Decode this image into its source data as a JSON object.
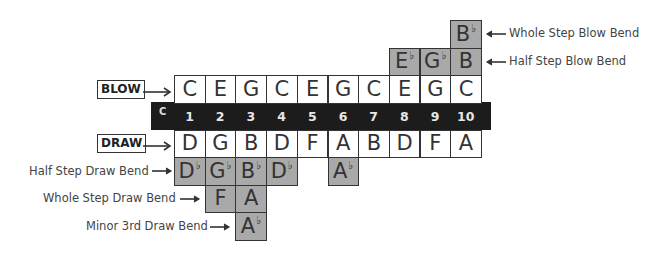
{
  "diagram": {
    "key_label": "C",
    "holes": [
      "1",
      "2",
      "3",
      "4",
      "5",
      "6",
      "7",
      "8",
      "9",
      "10"
    ],
    "row_labels": {
      "blow": "BLOW",
      "draw": "DRAW",
      "whole_step_blow_bend": "Whole Step Blow Bend",
      "half_step_blow_bend": "Half Step Blow Bend",
      "half_step_draw_bend": "Half Step Draw Bend",
      "whole_step_draw_bend": "Whole Step Draw Bend",
      "minor_3rd_draw_bend": "Minor 3rd Draw Bend"
    },
    "blow_notes": [
      "C",
      "E",
      "G",
      "C",
      "E",
      "G",
      "C",
      "E",
      "G",
      "C"
    ],
    "draw_notes": [
      "D",
      "G",
      "B",
      "D",
      "F",
      "A",
      "B",
      "D",
      "F",
      "A"
    ],
    "whole_step_blow_bend": [
      {
        "hole": 10,
        "note": "B",
        "flat": "♭"
      }
    ],
    "half_step_blow_bend": [
      {
        "hole": 8,
        "note": "E",
        "flat": "♭"
      },
      {
        "hole": 9,
        "note": "G",
        "flat": "♭"
      },
      {
        "hole": 10,
        "note": "B",
        "flat": ""
      }
    ],
    "half_step_draw_bend": [
      {
        "hole": 1,
        "note": "D",
        "flat": "♭"
      },
      {
        "hole": 2,
        "note": "G",
        "flat": "♭"
      },
      {
        "hole": 3,
        "note": "B",
        "flat": "♭"
      },
      {
        "hole": 4,
        "note": "D",
        "flat": "♭"
      },
      {
        "hole": 6,
        "note": "A",
        "flat": "♭"
      }
    ],
    "whole_step_draw_bend": [
      {
        "hole": 2,
        "note": "F",
        "flat": ""
      },
      {
        "hole": 3,
        "note": "A",
        "flat": ""
      }
    ],
    "minor_3rd_draw_bend": [
      {
        "hole": 3,
        "note": "A",
        "flat": "♭"
      }
    ],
    "colors": {
      "band": "#1c1c1c",
      "bend_cell": "#a9a9a9",
      "natural_cell": "#ffffff",
      "border": "#333333"
    }
  }
}
